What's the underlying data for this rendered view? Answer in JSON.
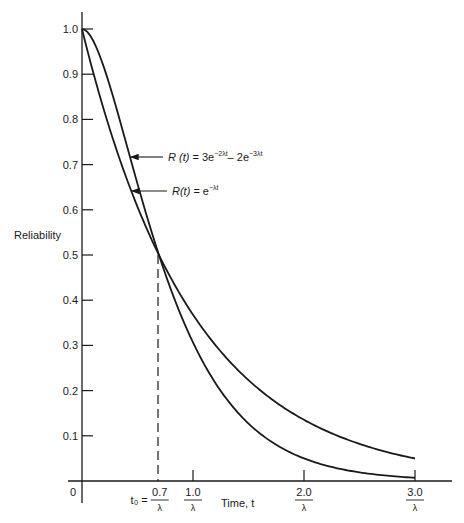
{
  "chart_data": {
    "type": "line",
    "title": "",
    "ylabel": "Reliability",
    "xlabel": "Time, t",
    "ylim": [
      0,
      1.0
    ],
    "xlim_lambda_t": [
      0,
      3.0
    ],
    "grid": false,
    "y_ticks": [
      "1.0",
      "0.9",
      "0.8",
      "0.7",
      "0.6",
      "0.5",
      "0.4",
      "0.3",
      "0.2",
      "0.1"
    ],
    "y_tick_values": [
      1.0,
      0.9,
      0.8,
      0.7,
      0.6,
      0.5,
      0.4,
      0.3,
      0.2,
      0.1
    ],
    "origin_label": "0",
    "x_ticks": [
      {
        "value": 0.7,
        "numerator": "0.7",
        "denominator": "λ",
        "prefix": "t₀ ="
      },
      {
        "value": 1.0,
        "numerator": "1.0",
        "denominator": "λ",
        "prefix": ""
      },
      {
        "value": 2.0,
        "numerator": "2.0",
        "denominator": "λ",
        "prefix": ""
      },
      {
        "value": 3.0,
        "numerator": "3.0",
        "denominator": "λ",
        "prefix": ""
      }
    ],
    "series": [
      {
        "name": "R(t) = 3e^(-2λt) − 2e^(-3λt)",
        "formula_parts": {
          "lhs": "R (t)",
          "eq": " = 3e",
          "sup1": "−2λt",
          "mid": "– 2e",
          "sup2": "−3λt"
        },
        "x_lambda_t": [
          0,
          0.1,
          0.2,
          0.3,
          0.4,
          0.5,
          0.6,
          0.7,
          0.8,
          1.0,
          1.2,
          1.5,
          2.0,
          2.5,
          3.0
        ],
        "values": [
          1.0,
          0.977,
          0.926,
          0.862,
          0.791,
          0.72,
          0.65,
          0.583,
          0.521,
          0.306,
          0.328,
          0.222,
          0.104,
          0.048,
          0.0074
        ]
      },
      {
        "name": "R(t) = e^(-λt)",
        "formula_parts": {
          "lhs": "R(t)",
          "eq": " = e",
          "sup1": "−λt"
        },
        "x_lambda_t": [
          0,
          0.1,
          0.2,
          0.3,
          0.4,
          0.5,
          0.6,
          0.7,
          0.8,
          1.0,
          1.2,
          1.5,
          2.0,
          2.5,
          3.0
        ],
        "values": [
          1.0,
          0.905,
          0.819,
          0.741,
          0.67,
          0.607,
          0.549,
          0.497,
          0.449,
          0.368,
          0.301,
          0.223,
          0.135,
          0.082,
          0.05
        ]
      }
    ],
    "annotations": [
      {
        "text": "Crossover at t₀ = 0.7/λ, R ≈ 0.5",
        "style": "dashed vertical line"
      }
    ]
  }
}
